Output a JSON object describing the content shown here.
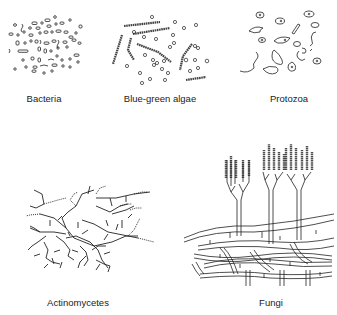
{
  "figure": {
    "panels": [
      {
        "id": "bacteria",
        "label": "Bacteria"
      },
      {
        "id": "blue-green-algae",
        "label": "Blue-green algae"
      },
      {
        "id": "protozoa",
        "label": "Protozoa"
      },
      {
        "id": "actinomycetes",
        "label": "Actinomycetes"
      },
      {
        "id": "fungi",
        "label": "Fungi"
      }
    ],
    "stroke_color": "#222222",
    "background": "#ffffff"
  }
}
